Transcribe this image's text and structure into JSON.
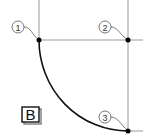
{
  "diagram": {
    "panel_label": "B",
    "points": [
      {
        "id": "1",
        "label": "1",
        "x": 39,
        "y": 40,
        "callout_x": 18,
        "callout_y": 27
      },
      {
        "id": "2",
        "label": "2",
        "x": 128,
        "y": 40,
        "callout_x": 105,
        "callout_y": 27
      },
      {
        "id": "3",
        "label": "3",
        "x": 128,
        "y": 131,
        "callout_x": 105,
        "callout_y": 117
      }
    ],
    "colors": {
      "guide_line": "#9a9a9a",
      "arc": "#111111",
      "point": "#000000",
      "callout": "#555555"
    }
  }
}
